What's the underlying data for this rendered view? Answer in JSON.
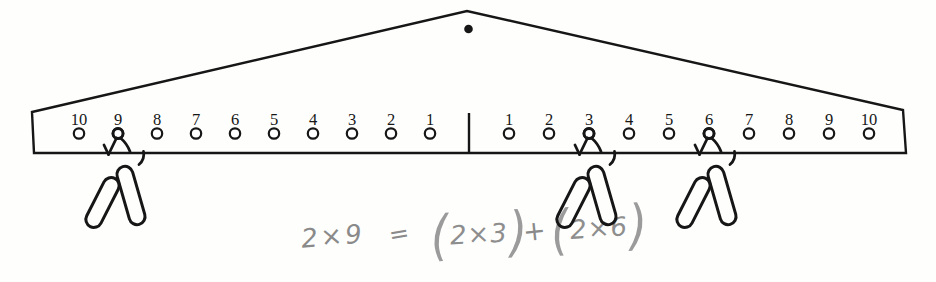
{
  "diagram": {
    "type": "number-balance-beam",
    "pivot_icon": "pivot-dot",
    "left_arm_labels": [
      "10",
      "9",
      "8",
      "7",
      "6",
      "5",
      "4",
      "3",
      "2",
      "1"
    ],
    "right_arm_labels": [
      "1",
      "2",
      "3",
      "4",
      "5",
      "6",
      "7",
      "8",
      "9",
      "10"
    ],
    "hangers": [
      {
        "side": "left",
        "peg": 9,
        "clips": 2
      },
      {
        "side": "right",
        "peg": 3,
        "clips": 2
      },
      {
        "side": "right",
        "peg": 6,
        "clips": 2
      }
    ]
  },
  "equation": {
    "full": "2×9 = (2×3) + (2×6)",
    "lhs": "2×9",
    "equals": "=",
    "plus": "+",
    "terms": [
      {
        "open": "(",
        "body": "2×3",
        "close": ")"
      },
      {
        "open": "(",
        "body": "2×6",
        "close": ")"
      }
    ]
  },
  "colors": {
    "ink": "#161616",
    "pencil": "#8a8a8a",
    "paper": "#fefefd"
  }
}
